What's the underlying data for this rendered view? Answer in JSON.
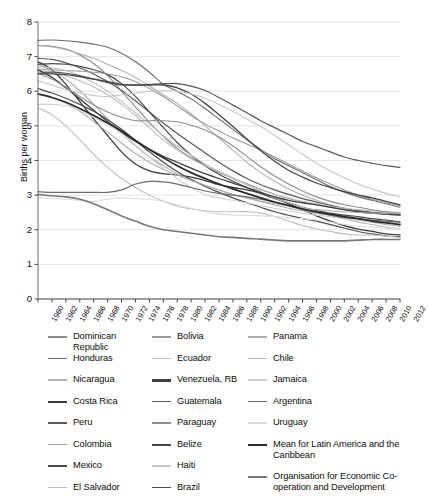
{
  "chart_data": {
    "type": "line",
    "title": "",
    "xlabel": "",
    "ylabel": "Births per woman",
    "ylim": [
      0,
      8
    ],
    "yticks": [
      0,
      1,
      2,
      3,
      4,
      5,
      6,
      7,
      8
    ],
    "xlim": [
      1960,
      2012
    ],
    "grid": "horizontal",
    "legend_position": "below",
    "x": [
      1960,
      1962,
      1964,
      1966,
      1968,
      1970,
      1972,
      1974,
      1976,
      1978,
      1980,
      1982,
      1984,
      1986,
      1988,
      1990,
      1992,
      1994,
      1996,
      1998,
      2000,
      2002,
      2004,
      2006,
      2008,
      2010,
      2012
    ],
    "xtick_labels": [
      "1960",
      "1962",
      "1964",
      "1966",
      "1968",
      "1970",
      "1972",
      "1974",
      "1976",
      "1978",
      "1980",
      "1982",
      "1984",
      "1986",
      "1988",
      "1990",
      "1992",
      "1994",
      "1996",
      "1998",
      "2000",
      "2002",
      "2004",
      "2006",
      "2008",
      "2010",
      "2012"
    ],
    "series": [
      {
        "name": "Dominican Republic",
        "color": "#8c8c8c",
        "width": 1.1,
        "values": [
          7.32,
          7.3,
          7.22,
          7.05,
          6.8,
          6.45,
          6.0,
          5.55,
          5.1,
          4.7,
          4.35,
          4.08,
          3.85,
          3.65,
          3.48,
          3.33,
          3.17,
          3.02,
          2.9,
          2.8,
          2.72,
          2.65,
          2.58,
          2.52,
          2.48,
          2.45,
          2.45
        ]
      },
      {
        "name": "Honduras",
        "color": "#6e6e6e",
        "width": 1.1,
        "values": [
          7.47,
          7.48,
          7.46,
          7.42,
          7.36,
          7.27,
          7.1,
          6.85,
          6.55,
          6.2,
          6.0,
          5.78,
          5.5,
          5.2,
          4.9,
          4.6,
          4.32,
          4.05,
          3.85,
          3.65,
          3.45,
          3.25,
          3.08,
          2.95,
          2.85,
          2.75,
          2.65
        ]
      },
      {
        "name": "Nicaragua",
        "color": "#b4b4b4",
        "width": 1.1,
        "values": [
          7.32,
          7.28,
          7.2,
          7.08,
          6.95,
          6.78,
          6.6,
          6.4,
          6.15,
          5.9,
          5.65,
          5.35,
          5.0,
          4.65,
          4.3,
          3.95,
          3.65,
          3.4,
          3.18,
          3.0,
          2.85,
          2.72,
          2.62,
          2.55,
          2.5,
          2.45,
          2.42
        ]
      },
      {
        "name": "Costa Rica",
        "color": "#3a3a3a",
        "width": 1.3,
        "values": [
          6.85,
          6.62,
          6.2,
          5.7,
          5.2,
          4.72,
          4.25,
          3.9,
          3.7,
          3.62,
          3.58,
          3.52,
          3.42,
          3.3,
          3.22,
          3.15,
          3.05,
          2.92,
          2.75,
          2.58,
          2.4,
          2.25,
          2.12,
          2.02,
          1.95,
          1.88,
          1.85
        ]
      },
      {
        "name": "Peru",
        "color": "#5a5a5a",
        "width": 1.2,
        "values": [
          6.95,
          6.92,
          6.82,
          6.68,
          6.5,
          6.28,
          6.02,
          5.72,
          5.4,
          5.08,
          4.78,
          4.5,
          4.22,
          3.95,
          3.7,
          3.48,
          3.3,
          3.15,
          3.02,
          2.9,
          2.8,
          2.7,
          2.62,
          2.55,
          2.5,
          2.48,
          2.45
        ]
      },
      {
        "name": "Colombia",
        "color": "#a8a8a8",
        "width": 1.1,
        "values": [
          6.78,
          6.6,
          6.35,
          6.02,
          5.62,
          5.2,
          4.8,
          4.42,
          4.1,
          3.85,
          3.62,
          3.45,
          3.28,
          3.15,
          3.02,
          2.92,
          2.82,
          2.72,
          2.62,
          2.55,
          2.48,
          2.42,
          2.35,
          2.28,
          2.22,
          2.15,
          2.1
        ]
      },
      {
        "name": "Mexico",
        "color": "#4a4a4a",
        "width": 1.2,
        "values": [
          6.78,
          6.8,
          6.78,
          6.72,
          6.62,
          6.48,
          6.22,
          5.85,
          5.4,
          4.95,
          4.52,
          4.15,
          3.85,
          3.6,
          3.4,
          3.22,
          3.05,
          2.9,
          2.78,
          2.65,
          2.55,
          2.48,
          2.42,
          2.38,
          2.32,
          2.28,
          2.22
        ]
      },
      {
        "name": "El Salvador",
        "color": "#bdbdbd",
        "width": 1.1,
        "values": [
          6.58,
          6.55,
          6.45,
          6.3,
          6.12,
          5.9,
          5.62,
          5.3,
          4.95,
          4.6,
          4.3,
          4.05,
          3.85,
          3.68,
          3.5,
          3.3,
          3.1,
          2.92,
          2.78,
          2.65,
          2.52,
          2.42,
          2.32,
          2.22,
          2.15,
          2.08,
          2.02
        ]
      },
      {
        "name": "Bolivia",
        "color": "#9a9a9a",
        "width": 1.1,
        "values": [
          6.62,
          6.62,
          6.6,
          6.58,
          6.55,
          6.5,
          6.42,
          6.28,
          6.08,
          5.85,
          5.58,
          5.3,
          5.05,
          4.85,
          4.65,
          4.48,
          4.3,
          4.1,
          3.9,
          3.7,
          3.5,
          3.32,
          3.15,
          3.0,
          2.88,
          2.78,
          2.7
        ]
      },
      {
        "name": "Ecuador",
        "color": "#c2c2c2",
        "width": 1.1,
        "values": [
          6.7,
          6.68,
          6.6,
          6.45,
          6.25,
          6.0,
          5.7,
          5.38,
          5.05,
          4.72,
          4.42,
          4.15,
          3.9,
          3.68,
          3.48,
          3.3,
          3.15,
          3.02,
          2.92,
          2.82,
          2.75,
          2.68,
          2.62,
          2.58,
          2.55,
          2.52,
          2.5
        ]
      },
      {
        "name": "Venezuela, RB",
        "color": "#404040",
        "width": 1.3,
        "values": [
          6.62,
          6.4,
          6.1,
          5.78,
          5.45,
          5.12,
          4.82,
          4.55,
          4.32,
          4.12,
          3.95,
          3.78,
          3.62,
          3.48,
          3.35,
          3.22,
          3.08,
          2.95,
          2.85,
          2.78,
          2.72,
          2.65,
          2.58,
          2.52,
          2.48,
          2.45,
          2.42
        ]
      },
      {
        "name": "Guatemala",
        "color": "#585858",
        "width": 1.2,
        "values": [
          6.52,
          6.55,
          6.52,
          6.45,
          6.35,
          6.25,
          6.18,
          6.18,
          6.2,
          6.22,
          6.22,
          6.15,
          6.02,
          5.82,
          5.6,
          5.38,
          5.15,
          4.95,
          4.75,
          4.55,
          4.4,
          4.25,
          4.1,
          4.0,
          3.92,
          3.85,
          3.8
        ]
      },
      {
        "name": "Paraguay",
        "color": "#8e8e8e",
        "width": 1.1,
        "values": [
          6.52,
          6.35,
          6.12,
          5.85,
          5.6,
          5.4,
          5.25,
          5.15,
          5.15,
          5.15,
          5.12,
          5.02,
          4.88,
          4.68,
          4.42,
          4.12,
          3.82,
          3.55,
          3.32,
          3.12,
          2.95,
          2.82,
          2.72,
          2.65,
          2.58,
          2.52,
          2.48
        ]
      },
      {
        "name": "Belize",
        "color": "#454545",
        "width": 1.3,
        "values": [
          6.5,
          6.5,
          6.48,
          6.42,
          6.35,
          6.28,
          6.2,
          6.18,
          6.18,
          6.18,
          6.1,
          5.92,
          5.65,
          5.32,
          4.98,
          4.62,
          4.28,
          3.98,
          3.72,
          3.52,
          3.35,
          3.22,
          3.1,
          3.0,
          2.92,
          2.82,
          2.72
        ]
      },
      {
        "name": "Haiti",
        "color": "#c8c8c8",
        "width": 1.1,
        "values": [
          6.3,
          6.18,
          6.05,
          5.95,
          5.88,
          5.85,
          5.9,
          5.95,
          6.0,
          6.02,
          6.0,
          5.92,
          5.8,
          5.62,
          5.42,
          5.2,
          4.98,
          4.72,
          4.45,
          4.18,
          3.92,
          3.7,
          3.5,
          3.32,
          3.18,
          3.05,
          2.95
        ]
      },
      {
        "name": "Brazil",
        "color": "#4f4f4f",
        "width": 1.2,
        "values": [
          6.08,
          5.95,
          5.8,
          5.62,
          5.42,
          5.18,
          4.9,
          4.58,
          4.25,
          3.95,
          3.68,
          3.45,
          3.25,
          3.08,
          2.92,
          2.78,
          2.65,
          2.52,
          2.42,
          2.32,
          2.25,
          2.15,
          2.05,
          1.95,
          1.88,
          1.82,
          1.8
        ]
      },
      {
        "name": "Panama",
        "color": "#b0b0b0",
        "width": 1.1,
        "values": [
          5.92,
          5.82,
          5.65,
          5.42,
          5.12,
          4.82,
          4.5,
          4.2,
          3.95,
          3.75,
          3.58,
          3.42,
          3.28,
          3.15,
          3.02,
          2.92,
          2.82,
          2.75,
          2.68,
          2.62,
          2.58,
          2.55,
          2.52,
          2.5,
          2.48,
          2.48,
          2.48
        ]
      },
      {
        "name": "Chile",
        "color": "#bfbfbf",
        "width": 1.1,
        "values": [
          5.52,
          5.32,
          5.0,
          4.6,
          4.18,
          3.8,
          3.48,
          3.22,
          3.0,
          2.82,
          2.68,
          2.6,
          2.55,
          2.52,
          2.52,
          2.52,
          2.48,
          2.38,
          2.25,
          2.12,
          2.02,
          1.95,
          1.88,
          1.85,
          1.85,
          1.82,
          1.78
        ]
      },
      {
        "name": "Jamaica",
        "color": "#d2d2d2",
        "width": 1.1,
        "values": [
          5.62,
          5.62,
          5.58,
          5.45,
          5.25,
          5.02,
          4.78,
          4.45,
          4.1,
          3.78,
          3.48,
          3.22,
          3.02,
          2.92,
          2.85,
          2.78,
          2.7,
          2.62,
          2.55,
          2.48,
          2.42,
          2.38,
          2.32,
          2.28,
          2.25,
          2.22,
          2.18
        ]
      },
      {
        "name": "Argentina",
        "color": "#6a6a6a",
        "width": 1.2,
        "values": [
          3.1,
          3.08,
          3.08,
          3.08,
          3.08,
          3.08,
          3.15,
          3.32,
          3.4,
          3.38,
          3.32,
          3.22,
          3.12,
          3.05,
          3.0,
          2.95,
          2.88,
          2.8,
          2.7,
          2.6,
          2.5,
          2.42,
          2.35,
          2.32,
          2.28,
          2.25,
          2.22
        ]
      },
      {
        "name": "Uruguay",
        "color": "#dcdcdc",
        "width": 1.1,
        "values": [
          2.92,
          2.9,
          2.88,
          2.85,
          2.82,
          2.88,
          2.92,
          2.9,
          2.88,
          2.82,
          2.72,
          2.62,
          2.52,
          2.45,
          2.42,
          2.42,
          2.4,
          2.38,
          2.35,
          2.32,
          2.28,
          2.22,
          2.15,
          2.1,
          2.08,
          2.05,
          2.02
        ]
      },
      {
        "name": "Mean for Latin America and the Caribbean",
        "color": "#2b2b2b",
        "width": 1.7,
        "values": [
          5.92,
          5.82,
          5.68,
          5.5,
          5.3,
          5.08,
          4.85,
          4.58,
          4.32,
          4.08,
          3.85,
          3.65,
          3.48,
          3.32,
          3.18,
          3.05,
          2.92,
          2.8,
          2.7,
          2.6,
          2.52,
          2.45,
          2.38,
          2.32,
          2.25,
          2.2,
          2.15
        ]
      },
      {
        "name": "Organisation for Economic Co-operation and Development",
        "color": "#777777",
        "width": 1.6,
        "values": [
          3.02,
          2.98,
          2.95,
          2.88,
          2.75,
          2.58,
          2.4,
          2.25,
          2.1,
          2.0,
          1.95,
          1.9,
          1.85,
          1.8,
          1.78,
          1.75,
          1.73,
          1.7,
          1.68,
          1.68,
          1.68,
          1.68,
          1.68,
          1.7,
          1.72,
          1.72,
          1.72
        ]
      }
    ]
  },
  "axis": {
    "ylabel": "Births per woman",
    "yticks": [
      "0",
      "1",
      "2",
      "3",
      "4",
      "5",
      "6",
      "7",
      "8"
    ],
    "xticks": [
      "1960",
      "1962",
      "1964",
      "1966",
      "1968",
      "1970",
      "1972",
      "1974",
      "1976",
      "1978",
      "1980",
      "1982",
      "1984",
      "1986",
      "1988",
      "1990",
      "1992",
      "1994",
      "1996",
      "1998",
      "2000",
      "2002",
      "2004",
      "2006",
      "2008",
      "2010",
      "2012"
    ]
  },
  "legend": {
    "columns": [
      {
        "items": [
          {
            "label": "Dominican Republic",
            "color": "#8c8c8c",
            "thick": false
          },
          {
            "label": "Honduras",
            "color": "#6e6e6e",
            "thick": false
          },
          {
            "label": "Nicaragua",
            "color": "#b4b4b4",
            "thick": false
          },
          {
            "label": "Costa Rica",
            "color": "#3a3a3a",
            "thick": true
          },
          {
            "label": "Peru",
            "color": "#5a5a5a",
            "thick": false
          },
          {
            "label": "Colombia",
            "color": "#a8a8a8",
            "thick": false
          },
          {
            "label": "Mexico",
            "color": "#4a4a4a",
            "thick": false
          },
          {
            "label": "El Salvador",
            "color": "#bdbdbd",
            "thick": false
          }
        ]
      },
      {
        "items": [
          {
            "label": "Bolivia",
            "color": "#9a9a9a",
            "thick": false
          },
          {
            "label": "Ecuador",
            "color": "#c2c2c2",
            "thick": false
          },
          {
            "label": "Venezuela, RB",
            "color": "#404040",
            "thick": true
          },
          {
            "label": "Guatemala",
            "color": "#585858",
            "thick": false
          },
          {
            "label": "Paraguay",
            "color": "#8e8e8e",
            "thick": false
          },
          {
            "label": "Belize",
            "color": "#454545",
            "thick": true
          },
          {
            "label": "Haiti",
            "color": "#c8c8c8",
            "thick": false
          },
          {
            "label": "Brazil",
            "color": "#4f4f4f",
            "thick": false
          }
        ]
      },
      {
        "items": [
          {
            "label": "Panama",
            "color": "#b0b0b0",
            "thick": false
          },
          {
            "label": "Chile",
            "color": "#bfbfbf",
            "thick": false
          },
          {
            "label": "Jamaica",
            "color": "#d2d2d2",
            "thick": false
          },
          {
            "label": "Argentina",
            "color": "#6a6a6a",
            "thick": false
          },
          {
            "label": "Uruguay",
            "color": "#dcdcdc",
            "thick": false
          },
          {
            "label": "Mean for Latin America and the Caribbean",
            "color": "#2b2b2b",
            "thick": true,
            "tall": true
          },
          {
            "label": "Organisation for Economic Co-operation and Development",
            "color": "#777777",
            "thick": true,
            "tall": true
          }
        ]
      }
    ]
  },
  "cutoff_text": " "
}
